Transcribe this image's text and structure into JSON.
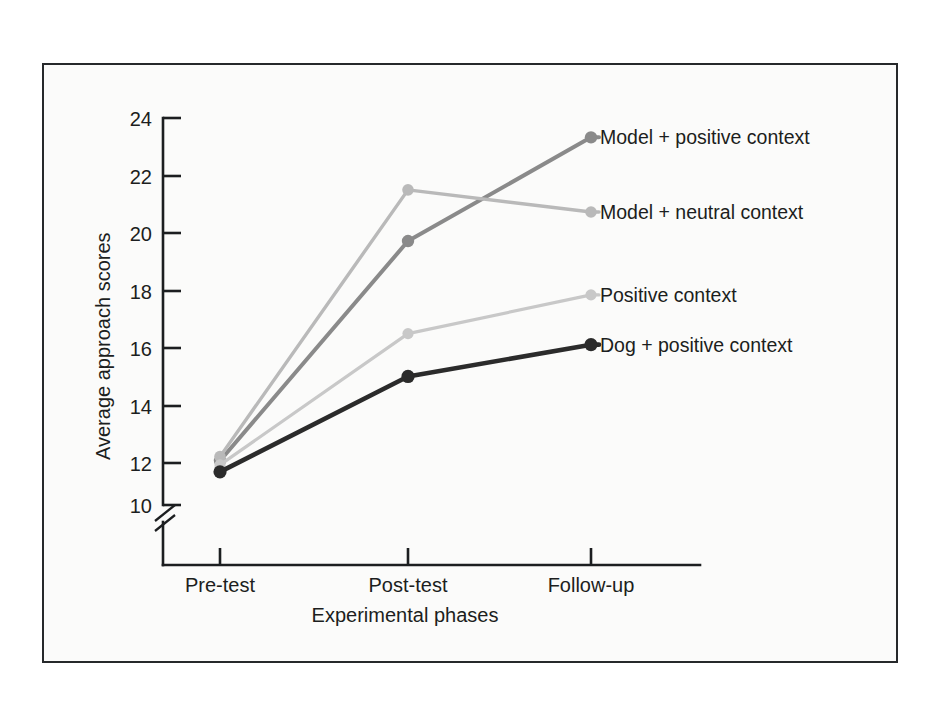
{
  "figure": {
    "background_color": "#fbfbfa",
    "frame_color": "#26292b",
    "axis_color": "#1c1e20"
  },
  "chart_data": {
    "type": "line",
    "title": "",
    "xlabel": "Experimental phases",
    "ylabel": "Average approach scores",
    "categories": [
      "Pre-test",
      "Post-test",
      "Follow-up"
    ],
    "yticks": [
      10,
      12,
      14,
      16,
      18,
      20,
      22,
      24
    ],
    "ylim": [
      10,
      24
    ],
    "y_axis_break": true,
    "grid": false,
    "legend_position": "right-inline-labels",
    "series": [
      {
        "name": "Model + positive context",
        "color": "#8a8a8a",
        "values": [
          11.6,
          19.55,
          23.3
        ],
        "label_y": 23.3
      },
      {
        "name": "Model + neutral context",
        "color": "#b9b9b9",
        "values": [
          11.75,
          21.4,
          20.6
        ],
        "label_y": 20.6
      },
      {
        "name": "Positive context",
        "color": "#c8c8c8",
        "values": [
          11.45,
          16.2,
          17.6
        ],
        "label_y": 17.6
      },
      {
        "name": "Dog + positive context",
        "color": "#2b2b2b",
        "values": [
          11.2,
          14.65,
          15.8
        ],
        "label_y": 15.8
      }
    ]
  }
}
